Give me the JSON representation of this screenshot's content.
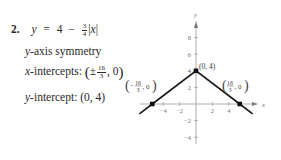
{
  "problem": {
    "number": "2.",
    "equation": {
      "lhs": "y",
      "eq": "=",
      "constant": "4",
      "minus": "−",
      "coef_num": "3",
      "coef_den": "4",
      "abs_open": "|",
      "var": "x",
      "abs_close": "|"
    },
    "symmetry": {
      "var": "y",
      "text": "-axis symmetry"
    },
    "x_intercepts": {
      "var": "x",
      "text": "-intercepts: ",
      "open": "(",
      "pm": "±",
      "num": "16",
      "den": "3",
      "rest": ", 0",
      "close": ")"
    },
    "y_intercept": {
      "var": "y",
      "text": "-intercept: ",
      "value": "(0, 4)"
    }
  },
  "chart_data": {
    "type": "line",
    "xlabel": "x",
    "ylabel": "y",
    "xlim": [
      -7,
      7.5
    ],
    "ylim": [
      -5,
      10
    ],
    "x_ticks": [
      -4,
      -2,
      2,
      4
    ],
    "x_tick_labels": [
      "−4",
      "−2",
      "2",
      "4"
    ],
    "y_ticks": [
      -4,
      -2,
      2,
      4,
      6,
      8
    ],
    "y_tick_labels": [
      "−4",
      "−2",
      "2",
      "4",
      "6",
      "8"
    ],
    "grid": false,
    "series": [
      {
        "name": "y = 4 - (3/4)|x|",
        "x": [
          -6.9,
          -5.333,
          0,
          5.333,
          6.9
        ],
        "y": [
          -1.175,
          0,
          4,
          0,
          -1.175
        ],
        "color": "#1a1a1a"
      }
    ],
    "points": [
      {
        "x": 0,
        "y": 4,
        "label": "(0, 4)"
      },
      {
        "x": -5.333,
        "y": 0,
        "label_num": "16",
        "label_den": "3",
        "label_sign": "−",
        "label_rest": ", 0"
      },
      {
        "x": 5.333,
        "y": 0,
        "label_num": "16",
        "label_den": "3",
        "label_sign": "",
        "label_rest": ", 0"
      }
    ]
  }
}
